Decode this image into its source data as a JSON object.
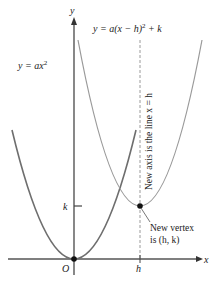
{
  "diagram": {
    "type": "parabola-translation",
    "axes": {
      "x_label": "x",
      "y_label": "y",
      "origin_label": "O",
      "h_tick_label": "h",
      "k_tick_label": "k"
    },
    "curves": [
      {
        "name": "original",
        "equation": "y = ax",
        "exponent": "2",
        "color": "#6e6e6e"
      },
      {
        "name": "shifted",
        "equation_prefix": "y = a(x − h)",
        "exponent": "2",
        "equation_suffix": " + k",
        "color": "#9a9a9a"
      }
    ],
    "annotations": {
      "new_axis": "New axis is the line x = h",
      "vertex_line1": "New vertex",
      "vertex_line2": "is (h, k)"
    },
    "colors": {
      "axis": "#555555",
      "dashed_axis": "#9a9a9a",
      "point": "#111111",
      "text": "#222222"
    }
  }
}
